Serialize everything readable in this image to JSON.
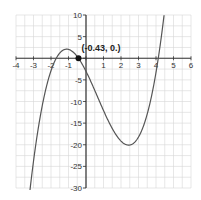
{
  "chart_data": {
    "type": "line",
    "title": "",
    "xlabel": "",
    "ylabel": "",
    "xlim": [
      -4,
      6
    ],
    "ylim": [
      -30,
      10
    ],
    "grid": true,
    "x_ticks": [
      -4,
      -3,
      -2,
      -1,
      1,
      2,
      3,
      4,
      5,
      6
    ],
    "x_tick_labels": [
      "-4",
      "-3",
      "-2",
      "-1",
      "1",
      "2",
      "3",
      "4",
      "5",
      "6"
    ],
    "y_ticks": [
      10,
      5,
      -5,
      -10,
      -15,
      -20,
      -25,
      -30
    ],
    "y_tick_labels": [
      "10",
      "5",
      "-5",
      "-10",
      "-15",
      "-20",
      "-25",
      "-30"
    ],
    "series": [
      {
        "name": "cubic",
        "function": "(x+1.7)(x+0.43)(x-4.13)",
        "roots": [
          -1.7,
          -0.43,
          4.13
        ],
        "local_max": {
          "x": -1.1,
          "y": 1.9
        },
        "local_min": {
          "x": 2.5,
          "y": -19.6
        },
        "color": "#555555"
      }
    ],
    "highlighted_point": {
      "x": -0.43,
      "y": 0,
      "label": "(-0.43, 0.)"
    }
  }
}
